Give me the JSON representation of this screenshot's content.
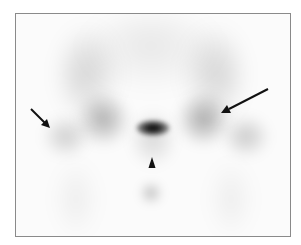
{
  "figure": {
    "type": "bone-scintigraphy",
    "view": "pelvis",
    "border_color": "#8a8a8a",
    "background": "#fbfbfb",
    "uptake_color": "#1a1a1a"
  },
  "annotations": [
    {
      "kind": "arrow",
      "name": "left-arrow",
      "from": [
        31,
        109
      ],
      "to": [
        50,
        128
      ]
    },
    {
      "kind": "arrow",
      "name": "right-arrow",
      "from": [
        268,
        89
      ],
      "to": [
        222,
        113
      ]
    },
    {
      "kind": "arrowhead",
      "name": "midline-arrowhead",
      "tip": [
        152,
        157
      ],
      "direction": "up"
    }
  ],
  "hotspots": [
    {
      "name": "sacral-hot-spot",
      "center": [
        152,
        127
      ],
      "intensity": "high"
    },
    {
      "name": "lower-midline-spot",
      "center": [
        150,
        191
      ],
      "intensity": "moderate"
    },
    {
      "name": "left-sacroiliac-region",
      "center": [
        100,
        115
      ],
      "intensity": "moderate"
    },
    {
      "name": "right-sacroiliac-region",
      "center": [
        200,
        115
      ],
      "intensity": "moderate"
    }
  ]
}
